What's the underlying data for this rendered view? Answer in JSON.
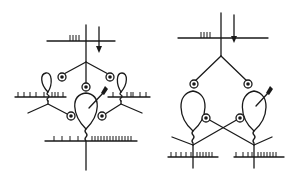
{
  "figure": {
    "colors": {
      "background": "#ffffff",
      "ink": "#1a1a1a"
    },
    "panels": [
      {
        "id": "left",
        "arrows": 2,
        "circled_dots": 5,
        "loops": 3
      },
      {
        "id": "right",
        "arrows": 2,
        "circled_dots": 4,
        "loops": 2
      }
    ]
  }
}
